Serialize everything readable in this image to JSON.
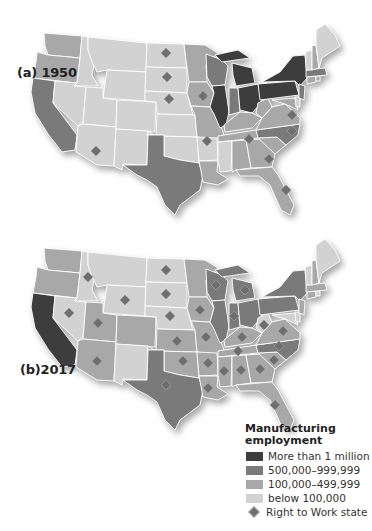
{
  "colors": {
    "more_than_1m": "#3d3d3d",
    "500k_999k": "#7a7a7a",
    "100k_499k": "#a8a8a8",
    "below_100k": "#d2d2d2",
    "rtw_marker": "#6e6e6e"
  },
  "panels": [
    {
      "label": "(a) 1950",
      "year": "1950"
    },
    {
      "label": "(b)2017",
      "year": "2017"
    }
  ],
  "legend": {
    "title_line1": "Manufacturing",
    "title_line2": "employment",
    "items": [
      {
        "label": "More than 1 million",
        "color": "#3d3d3d"
      },
      {
        "label": "500,000–999,999",
        "color": "#7a7a7a"
      },
      {
        "label": "100,000–499,999",
        "color": "#a8a8a8"
      },
      {
        "label": "below 100,000",
        "color": "#d2d2d2"
      }
    ],
    "marker_label": "Right to Work state"
  },
  "map_1950": {
    "more_than_1m": [
      "IL",
      "MI",
      "OH",
      "PA",
      "NY"
    ],
    "500k_999k": [
      "CA",
      "TX",
      "IN",
      "WI",
      "NJ",
      "MA",
      "NC"
    ],
    "100k_499k": [
      "WA",
      "OR",
      "MN",
      "IA",
      "MO",
      "KY",
      "TN",
      "AL",
      "GA",
      "SC",
      "VA",
      "WV",
      "MD",
      "CT",
      "RI",
      "LA",
      "FL",
      "NH"
    ],
    "below_100k": [
      "ID",
      "MT",
      "WY",
      "NV",
      "UT",
      "CO",
      "AZ",
      "NM",
      "ND",
      "SD",
      "NE",
      "KS",
      "OK",
      "AR",
      "MS",
      "ME",
      "VT",
      "DE"
    ],
    "right_to_work": [
      "ND",
      "SD",
      "NE",
      "IA",
      "AZ",
      "AR",
      "TN",
      "VA",
      "NC",
      "GA",
      "FL"
    ]
  },
  "map_2017": {
    "more_than_1m": [
      "CA"
    ],
    "500k_999k": [
      "TX",
      "IL",
      "OH",
      "MI",
      "IN",
      "PA",
      "NY",
      "WI",
      "NC"
    ],
    "100k_499k": [
      "WA",
      "OR",
      "UT",
      "AZ",
      "CO",
      "MN",
      "IA",
      "MO",
      "KS",
      "OK",
      "AR",
      "LA",
      "MS",
      "AL",
      "GA",
      "SC",
      "TN",
      "KY",
      "VA",
      "NJ",
      "MA",
      "CT",
      "FL",
      "NH"
    ],
    "below_100k": [
      "ID",
      "MT",
      "WY",
      "NV",
      "NM",
      "ND",
      "SD",
      "NE",
      "ME",
      "VT",
      "WV",
      "DE",
      "RI",
      "MD"
    ],
    "right_to_work": [
      "ID",
      "WY",
      "NV",
      "UT",
      "AZ",
      "ND",
      "SD",
      "NE",
      "KS",
      "OK",
      "TX",
      "IA",
      "MO",
      "AR",
      "LA",
      "MS",
      "AL",
      "GA",
      "FL",
      "SC",
      "NC",
      "TN",
      "KY",
      "VA",
      "WV",
      "IN",
      "MI",
      "WI"
    ]
  }
}
